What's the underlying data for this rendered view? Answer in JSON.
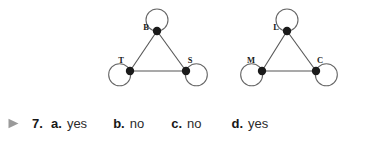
{
  "figure": {
    "graphs": [
      {
        "name": "graph-1",
        "vertices": [
          {
            "label": "B",
            "x": 157,
            "y": 31,
            "label_dx": -11,
            "label_dy": -1,
            "loop_angle": 90
          },
          {
            "label": "T",
            "x": 130,
            "y": 71,
            "label_dx": -9,
            "label_dy": -8,
            "loop_angle": 200
          },
          {
            "label": "S",
            "x": 186,
            "y": 71,
            "label_dx": 4,
            "label_dy": -8,
            "loop_angle": 340
          }
        ],
        "edges": [
          {
            "from": "B",
            "to": "T"
          },
          {
            "from": "B",
            "to": "S"
          },
          {
            "from": "T",
            "to": "S"
          }
        ],
        "loops": [
          "B",
          "T",
          "S"
        ]
      },
      {
        "name": "graph-2",
        "vertices": [
          {
            "label": "L",
            "x": 287,
            "y": 31,
            "label_dx": -11,
            "label_dy": -1,
            "loop_angle": 90
          },
          {
            "label": "M",
            "x": 262,
            "y": 71,
            "label_dx": -11,
            "label_dy": -8,
            "loop_angle": 200
          },
          {
            "label": "C",
            "x": 316,
            "y": 71,
            "label_dx": 4,
            "label_dy": -8,
            "loop_angle": 340
          }
        ],
        "edges": [
          {
            "from": "L",
            "to": "M"
          },
          {
            "from": "L",
            "to": "C"
          },
          {
            "from": "M",
            "to": "C"
          }
        ],
        "loops": [
          "L",
          "M",
          "C"
        ]
      }
    ],
    "style": {
      "edge_color": "#555555",
      "loop_color": "#666666",
      "vertex_color": "#1a1a1a",
      "vertex_radius": 4.2,
      "loop_radius": 11,
      "edge_width": 1.1
    }
  },
  "answer_row": {
    "marker_icon": "right-triangle-marker",
    "marker_color": "#9a9a9a",
    "question_number": "7.",
    "choices": [
      {
        "letter": "a.",
        "value": "yes"
      },
      {
        "letter": "b.",
        "value": "no"
      },
      {
        "letter": "c.",
        "value": "no"
      },
      {
        "letter": "d.",
        "value": "yes"
      }
    ]
  }
}
